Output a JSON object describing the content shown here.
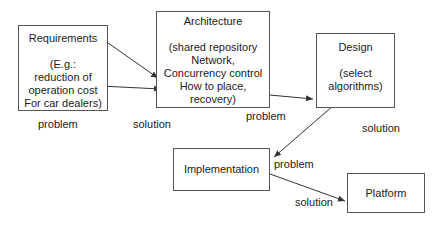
{
  "boxes": {
    "requirements": {
      "title": "Requirements",
      "desc": "(E.g.:\nreduction of\noperation cost\nFor car dealers)"
    },
    "architecture": {
      "title": "Architecture",
      "desc": "(shared repository\nNetwork,\nConcurrency control\nHow to place,\nrecovery)"
    },
    "design": {
      "title": "Design",
      "desc": "(select\nalgorithms)"
    },
    "implementation": {
      "title": "Implementation"
    },
    "platform": {
      "title": "Platform"
    }
  },
  "labels": {
    "req_problem": "problem",
    "arch_solution": "solution",
    "arch_problem": "problem",
    "design_solution": "solution",
    "impl_problem": "problem",
    "impl_solution": "solution"
  }
}
